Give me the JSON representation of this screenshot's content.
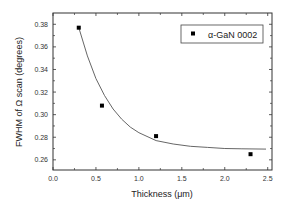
{
  "chart_data": {
    "type": "scatter",
    "title": "",
    "xlabel": "Thickness (μm)",
    "ylabel": "FWHM of Ω scan (degrees)",
    "xlim": [
      0.0,
      2.55
    ],
    "ylim": [
      0.251,
      0.39
    ],
    "x_ticks": [
      "0.0",
      "0.5",
      "1.0",
      "1.5",
      "2.0",
      "2.5"
    ],
    "y_ticks": [
      "0.26",
      "0.28",
      "0.30",
      "0.32",
      "0.34",
      "0.36",
      "0.38"
    ],
    "grid": false,
    "legend_position": "upper right",
    "series": [
      {
        "name": "α-GaN 0002",
        "marker": "square",
        "color": "#000000",
        "x": [
          0.3,
          0.57,
          1.2,
          2.3
        ],
        "y": [
          0.377,
          0.308,
          0.281,
          0.265
        ]
      },
      {
        "name": "exponential fit",
        "type": "line",
        "color": "#555555",
        "x": [
          0.3,
          0.4,
          0.5,
          0.6,
          0.7,
          0.8,
          0.9,
          1.0,
          1.2,
          1.4,
          1.6,
          1.8,
          2.0,
          2.2,
          2.48
        ],
        "y": [
          0.377,
          0.352,
          0.332,
          0.317,
          0.305,
          0.296,
          0.289,
          0.284,
          0.277,
          0.274,
          0.272,
          0.271,
          0.27,
          0.2698,
          0.2695
        ]
      }
    ]
  },
  "legend": {
    "label": "α-GaN 0002"
  },
  "axes": {
    "xlabel": "Thickness (μm)",
    "ylabel": "FWHM of Ω scan (degrees)",
    "x_tick_labels": [
      "0.0",
      "0.5",
      "1.0",
      "1.5",
      "2.0",
      "2.5"
    ],
    "y_tick_labels": [
      "0.26",
      "0.28",
      "0.30",
      "0.32",
      "0.34",
      "0.36",
      "0.38"
    ]
  }
}
